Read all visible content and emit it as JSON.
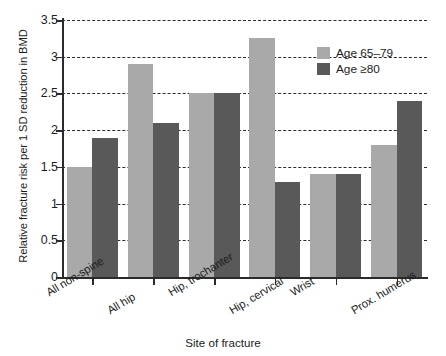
{
  "chart_data": {
    "type": "bar",
    "title": "",
    "xlabel": "Site of fracture",
    "ylabel": "Relative fracture risk per 1 SD reduction in BMD",
    "ylim": [
      0,
      3.5
    ],
    "yticks": [
      0,
      0.5,
      1,
      1.5,
      2,
      2.5,
      3,
      3.5
    ],
    "ytick_labels": [
      "0",
      "0.5",
      "1",
      "1.5",
      "2",
      "2.5",
      "3",
      "3.5"
    ],
    "grid": true,
    "grid_style": "dashed-horizontal",
    "legend_position": "upper-right-inside",
    "categories": [
      "All non-spine",
      "All hip",
      "Hip, trochanter",
      "Hip, cervical",
      "Wrist",
      "Prox. humerus"
    ],
    "series": [
      {
        "name": "Age 65–79",
        "color": "#a9a9a9",
        "values": [
          1.5,
          2.9,
          2.5,
          3.25,
          1.4,
          1.8
        ]
      },
      {
        "name": "Age ≥80",
        "color": "#595959",
        "values": [
          1.9,
          2.1,
          2.5,
          1.3,
          1.4,
          2.4
        ]
      }
    ]
  },
  "legend": {
    "items": [
      {
        "label": "Age 65–79",
        "swatch": "series-a"
      },
      {
        "label": "Age ≥80",
        "swatch": "series-b"
      }
    ]
  },
  "axes": {
    "y_title": "Relative fracture risk per 1 SD reduction in BMD",
    "x_title": "Site of fracture"
  }
}
